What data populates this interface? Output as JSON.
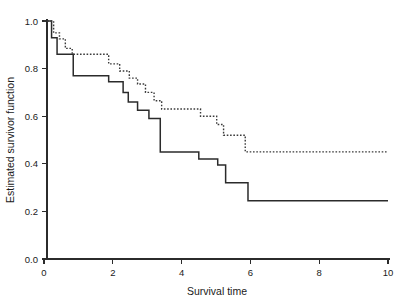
{
  "chart_data": {
    "type": "line",
    "title": "",
    "subtitle": "",
    "xlabel": "Survival time",
    "ylabel": "Estimated survivor function",
    "xlim": [
      0,
      10
    ],
    "ylim": [
      0.0,
      1.0
    ],
    "xticks": [
      0,
      2,
      4,
      6,
      8,
      10
    ],
    "xtick_labels": [
      "0",
      "2",
      "4",
      "6",
      "8",
      "10"
    ],
    "yticks": [
      0.0,
      0.2,
      0.4,
      0.6,
      0.8,
      1.0
    ],
    "ytick_labels": [
      "0.0",
      "0.2",
      "0.4",
      "0.6",
      "0.8",
      "1.0"
    ],
    "grid": false,
    "legend": null,
    "legend_position": "none",
    "step_style": "post",
    "series": [
      {
        "name": "group-1-solid",
        "line_style": "solid",
        "color": "#2b2b2b",
        "final_value": 0.245,
        "x": [
          0.0,
          0.22,
          0.22,
          0.38,
          0.38,
          0.85,
          0.85,
          1.88,
          1.88,
          2.3,
          2.3,
          2.45,
          2.45,
          2.72,
          2.72,
          3.05,
          3.05,
          3.38,
          3.38,
          4.5,
          4.5,
          5.05,
          5.05,
          5.28,
          5.28,
          5.93,
          5.93,
          10.0
        ],
        "y": [
          1.0,
          1.0,
          0.93,
          0.93,
          0.86,
          0.86,
          0.77,
          0.77,
          0.745,
          0.745,
          0.7,
          0.7,
          0.66,
          0.66,
          0.625,
          0.625,
          0.59,
          0.59,
          0.45,
          0.45,
          0.42,
          0.42,
          0.395,
          0.395,
          0.32,
          0.32,
          0.245,
          0.245
        ]
      },
      {
        "name": "group-2-dotted",
        "line_style": "dotted",
        "color": "#3a3a3a",
        "final_value": 0.45,
        "x": [
          0.0,
          0.28,
          0.28,
          0.45,
          0.45,
          0.62,
          0.62,
          0.82,
          0.82,
          1.88,
          1.88,
          2.2,
          2.2,
          2.48,
          2.48,
          2.72,
          2.72,
          2.95,
          2.95,
          3.2,
          3.2,
          3.42,
          3.42,
          4.55,
          4.55,
          5.02,
          5.02,
          5.22,
          5.22,
          5.85,
          5.85,
          10.0
        ],
        "y": [
          1.0,
          1.0,
          0.95,
          0.95,
          0.925,
          0.925,
          0.885,
          0.885,
          0.86,
          0.86,
          0.82,
          0.82,
          0.79,
          0.79,
          0.76,
          0.76,
          0.735,
          0.735,
          0.7,
          0.7,
          0.665,
          0.665,
          0.63,
          0.63,
          0.6,
          0.6,
          0.565,
          0.565,
          0.52,
          0.52,
          0.45,
          0.45
        ]
      }
    ]
  },
  "axes": {
    "x_title": "Survival time",
    "y_title": "Estimated survivor function"
  }
}
